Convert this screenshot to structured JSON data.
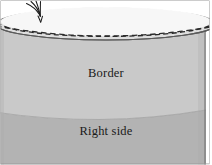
{
  "figure": {
    "type": "cylinder-cross-section-diagram",
    "width": 212,
    "height": 165,
    "background_color": "#ffffff",
    "frame_color": "#9a9a9a"
  },
  "labels": {
    "border": "Border",
    "right_side": "Right side"
  },
  "regions": {
    "upper_band": {
      "name": "Border",
      "fill_color": "#c9c9c9",
      "description": "upper cylindrical band of the solid, lighter gray"
    },
    "lower_band": {
      "name": "Right side",
      "fill_color": "#b3b3b3",
      "description": "lower cylindrical band of the solid, darker gray"
    },
    "top_face": {
      "fill_color": "#f6f6f6",
      "description": "top elliptical face of the cylinder, near white"
    },
    "rim_band": {
      "fill_color": "#dedede",
      "description": "thin shaded rim between outer and inner top ellipses"
    }
  },
  "strokes": {
    "outline_color": "#5a5a5a",
    "dashed_color": "#2b2b2b",
    "divider_color": "#9f9f9f",
    "annotation_color": "#1c1c1c"
  },
  "annotations": {
    "pen_mark": {
      "icon": "hand-drawn-scribble-icon",
      "description": "small hand-drawn fork-like pen stroke crossing the top rim at upper left"
    }
  },
  "curves": {
    "top_ellipse_outer": {
      "cx": 106,
      "cy": 24,
      "rx": 110,
      "ry": 16
    },
    "top_ellipse_inner_dashed": {
      "cx": 106,
      "cy": 22,
      "rx": 104,
      "ry": 14
    },
    "second_dashed_arc_depth": 12,
    "band_divider_sag": 11
  }
}
